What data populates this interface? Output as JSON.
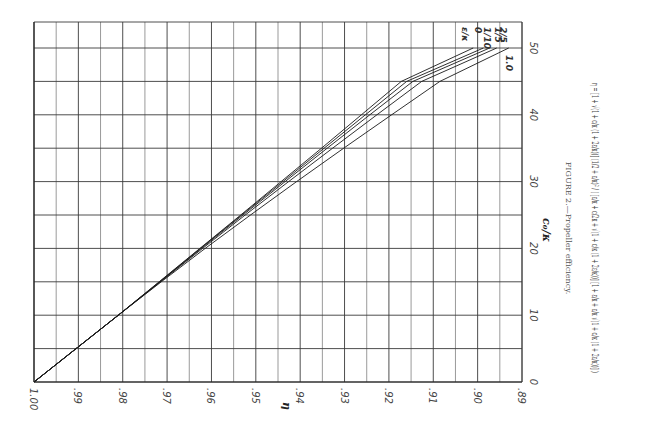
{
  "chart_data": {
    "type": "line",
    "orientation": "rotated-90",
    "title": "FIGURE 2.—Propeller efficiency.",
    "xlabel": "η",
    "ylabel": "c₀/κ",
    "x_axis": {
      "label": "η",
      "range": [
        1.0,
        0.89
      ],
      "ticks": [
        1.0,
        0.99,
        0.98,
        0.97,
        0.96,
        0.95,
        0.94,
        0.93,
        0.92,
        0.91,
        0.9,
        0.89
      ],
      "tick_labels": [
        "1.00",
        ".99",
        ".98",
        ".97",
        ".96",
        ".95",
        ".94",
        ".93",
        ".92",
        ".91",
        ".90",
        ".89"
      ],
      "minor_step": 0.005
    },
    "y_axis": {
      "label": "c₀/κ",
      "range": [
        0,
        54
      ],
      "ticks": [
        0,
        10,
        20,
        30,
        40,
        50
      ],
      "tick_labels": [
        "0",
        "10",
        "20",
        "30",
        "40",
        "50"
      ],
      "minor_step": 5
    },
    "grid": true,
    "legend": {
      "title": "ε/κ",
      "placement": "top-right",
      "entries": [
        "0",
        "1/10",
        "1/5",
        "2/5",
        "1.0"
      ]
    },
    "series": [
      {
        "name": "0",
        "points": [
          [
            1.0,
            0
          ],
          [
            0.9905,
            5
          ],
          [
            0.981,
            10
          ],
          [
            0.9718,
            15
          ],
          [
            0.9626,
            20
          ],
          [
            0.9534,
            25
          ],
          [
            0.9443,
            30
          ],
          [
            0.9352,
            35
          ],
          [
            0.9262,
            40
          ],
          [
            0.9172,
            45
          ],
          [
            0.901,
            50
          ]
        ]
      },
      {
        "name": "1/10",
        "points": [
          [
            1.0,
            0
          ],
          [
            0.9905,
            5
          ],
          [
            0.981,
            10
          ],
          [
            0.9717,
            15
          ],
          [
            0.9625,
            20
          ],
          [
            0.9532,
            25
          ],
          [
            0.9439,
            30
          ],
          [
            0.9346,
            35
          ],
          [
            0.9253,
            40
          ],
          [
            0.916,
            45
          ],
          [
            0.8987,
            50
          ]
        ]
      },
      {
        "name": "1/5",
        "points": [
          [
            1.0,
            0
          ],
          [
            0.9905,
            5
          ],
          [
            0.981,
            10
          ],
          [
            0.9716,
            15
          ],
          [
            0.9623,
            20
          ],
          [
            0.9529,
            25
          ],
          [
            0.9434,
            30
          ],
          [
            0.9339,
            35
          ],
          [
            0.9243,
            40
          ],
          [
            0.9146,
            45
          ],
          [
            0.8973,
            50
          ]
        ]
      },
      {
        "name": "2/5",
        "points": [
          [
            1.0,
            0
          ],
          [
            0.9905,
            5
          ],
          [
            0.981,
            10
          ],
          [
            0.9715,
            15
          ],
          [
            0.962,
            20
          ],
          [
            0.9524,
            25
          ],
          [
            0.9426,
            30
          ],
          [
            0.9327,
            35
          ],
          [
            0.9227,
            40
          ],
          [
            0.9126,
            45
          ],
          [
            0.8957,
            50
          ]
        ]
      },
      {
        "name": "1.0",
        "points": [
          [
            1.0,
            0
          ],
          [
            0.9905,
            5
          ],
          [
            0.981,
            10
          ],
          [
            0.9713,
            15
          ],
          [
            0.9614,
            20
          ],
          [
            0.9512,
            25
          ],
          [
            0.9408,
            30
          ],
          [
            0.9302,
            35
          ],
          [
            0.9194,
            40
          ],
          [
            0.9085,
            45
          ],
          [
            0.893,
            50
          ]
        ]
      }
    ],
    "caption": "FIGURE 2.—Propeller efficiency.",
    "formula": "η = [1 + √(1 + c/κ (1 + 2ε/κ))] (1/2 + ε/κ)² / ( [ε/κ + c/2κ + √(1 + c/κ (1 + 2ε/κ))] [1 + ε/κ + ε/κ √(1 + c/κ (1 + 2ε/κ))] )"
  }
}
